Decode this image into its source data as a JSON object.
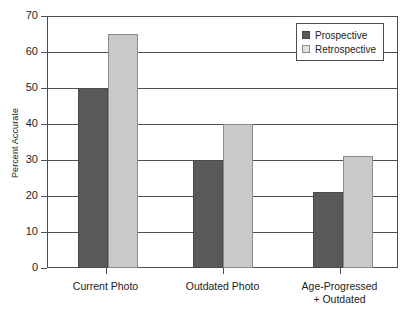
{
  "chart_data": {
    "type": "bar",
    "title": "",
    "xlabel": "",
    "ylabel": "Percent Accurate",
    "ylim": [
      0,
      70
    ],
    "yticks": [
      0,
      10,
      20,
      30,
      40,
      50,
      60,
      70
    ],
    "ytick_labels": [
      "0",
      "10",
      "20",
      "30",
      "40",
      "50",
      "60",
      "70"
    ],
    "grid": "horizontal",
    "legend_position": "top-right",
    "categories": [
      "Current Photo",
      "Outdated Photo",
      "Age-Progressed\n+ Outdated"
    ],
    "series": [
      {
        "name": "Prospective",
        "color": "#595959",
        "values": [
          50,
          30,
          21
        ]
      },
      {
        "name": "Retrospective",
        "color": "#c9c9c9",
        "values": [
          65,
          40,
          31
        ]
      }
    ]
  },
  "legend": {
    "items": [
      {
        "label": "Prospective",
        "swatch": "dark"
      },
      {
        "label": "Retrospective",
        "swatch": "light"
      }
    ]
  },
  "axes": {
    "y_title": "Percent Accurate"
  },
  "colors": {
    "prospective": "#595959",
    "retrospective": "#c9c9c9",
    "axis": "#4d4d4d",
    "text": "#1c1c1c",
    "background": "#ffffff"
  }
}
